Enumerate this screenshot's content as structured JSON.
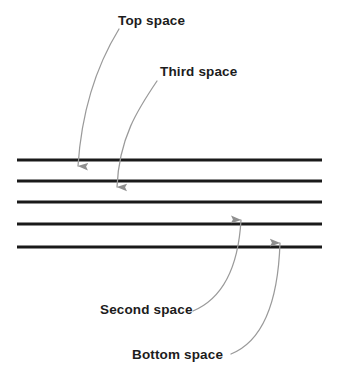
{
  "diagram": {
    "background_color": "#ffffff",
    "staff": {
      "name": "five-line-staff",
      "line_color": "#1a1a1a",
      "line_thickness_px": 3,
      "line_x_start": 17,
      "line_x_end": 322,
      "lines": [
        {
          "name": "staff-line-5-top",
          "y": 160,
          "ordinal": 5
        },
        {
          "name": "staff-line-4",
          "y": 181,
          "ordinal": 4
        },
        {
          "name": "staff-line-3-middle",
          "y": 202,
          "ordinal": 3
        },
        {
          "name": "staff-line-2",
          "y": 224,
          "ordinal": 2
        },
        {
          "name": "staff-line-1-bottom",
          "y": 247,
          "ordinal": 1
        }
      ]
    },
    "annotation_color": "#9a9a9a",
    "labels": [
      {
        "id": "top-space",
        "text": "Top space",
        "x": 118,
        "y": 14,
        "points_to": "space between line 5 and line 4"
      },
      {
        "id": "third-space",
        "text": "Third space",
        "x": 160,
        "y": 65,
        "points_to": "space between line 4 and line 3"
      },
      {
        "id": "second-space",
        "text": "Second space",
        "x": 100,
        "y": 303,
        "points_to": "space between line 3 and line 2"
      },
      {
        "id": "bottom-space",
        "text": "Bottom space",
        "x": 132,
        "y": 348,
        "points_to": "space between line 2 and line 1"
      }
    ],
    "arrows": [
      {
        "id": "arrow-top-space",
        "direction": "down",
        "from": {
          "x": 119,
          "y": 29
        },
        "to": {
          "x": 78,
          "y": 173
        },
        "path": "M119,29 C100,60 82,105 78,166"
      },
      {
        "id": "arrow-third-space",
        "direction": "down",
        "from": {
          "x": 157,
          "y": 81
        },
        "to": {
          "x": 117,
          "y": 194
        },
        "path": "M157,81 C138,109 119,138 117,187"
      },
      {
        "id": "arrow-second-space",
        "direction": "up",
        "from": {
          "x": 193,
          "y": 311
        },
        "to": {
          "x": 241,
          "y": 213
        },
        "path": "M193,311 C219,300 238,272 241,220"
      },
      {
        "id": "arrow-bottom-space",
        "direction": "up",
        "from": {
          "x": 231,
          "y": 354
        },
        "to": {
          "x": 280,
          "y": 236
        },
        "path": "M231,354 C263,341 278,303 280,243"
      }
    ]
  }
}
